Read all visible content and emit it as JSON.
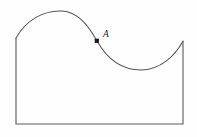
{
  "figure": {
    "background_color": "#fefefe",
    "stroke_color": "#555555",
    "label_color": "#1a1a1a",
    "points": [
      {
        "name": "A",
        "label": "A",
        "x": 97,
        "y": 41,
        "label_x": 103,
        "label_y": 37,
        "description": "inflection point on the descending part of the curve"
      }
    ],
    "geometry": {
      "left_edge_x": 16,
      "right_edge_x": 183,
      "baseline_y": 124,
      "left_curve_start_y": 38,
      "right_curve_end_y": 41,
      "peak_x": 62,
      "peak_y": 11,
      "trough_x": 141,
      "trough_y": 70
    },
    "chart_data": {
      "type": "line",
      "title": "",
      "xlabel": "",
      "ylabel": "",
      "grid": false,
      "legend": "none",
      "annotations": [
        "A"
      ],
      "x": [
        16,
        30,
        44,
        62,
        80,
        97,
        114,
        128,
        141,
        157,
        170,
        183
      ],
      "y": [
        38,
        25,
        15,
        11,
        21,
        41,
        58,
        66,
        70,
        64,
        54,
        41
      ],
      "xlim": [
        16,
        183
      ],
      "ylim": [
        11,
        124
      ],
      "closed_region": true,
      "region_vertices": [
        [
          16,
          38
        ],
        [
          16,
          124
        ],
        [
          183,
          124
        ],
        [
          183,
          41
        ]
      ]
    }
  }
}
